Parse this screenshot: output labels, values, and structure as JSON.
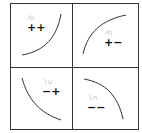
{
  "diagram": {
    "layout": "2x2 grid of quadrants, each with a monotone curve and a sign-pair label",
    "quadrants": [
      {
        "position": "top-left",
        "label": "++",
        "annotation": "unreadable faint gray glyph",
        "curve": "increasing, convex"
      },
      {
        "position": "top-right",
        "label": "+−",
        "annotation": "unreadable faint gray glyph",
        "curve": "increasing, concave"
      },
      {
        "position": "bottom-left",
        "label": "−+",
        "annotation": "unreadable faint gray glyph",
        "curve": "decreasing, convex"
      },
      {
        "position": "bottom-right",
        "label": "−−",
        "annotation": "unreadable faint gray glyph",
        "curve": "decreasing, concave"
      }
    ],
    "colors": {
      "border": "#333333",
      "curve": "#333333",
      "label": "#111111",
      "annotation": "#bbbbbb"
    }
  }
}
